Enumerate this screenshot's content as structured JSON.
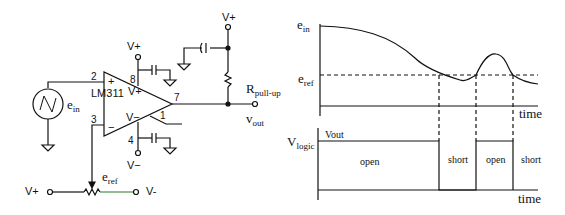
{
  "circuit": {
    "chip": "LM311",
    "pins": {
      "in_plus": "2",
      "in_minus": "3",
      "vplus": "8",
      "vminus": "4",
      "out": "7",
      "gnd": "1"
    },
    "op_symbols": {
      "plus": "+",
      "minus": "−",
      "vplus": "V+",
      "vminus": "V−"
    },
    "supply_top": "V+",
    "supply_bottom": "V−",
    "output_supply": "V+",
    "source_label": "e",
    "source_sub": "in",
    "resistor_label": "R",
    "resistor_sub": "pull-up",
    "output_label": "v",
    "output_sub": "out",
    "ref_label": "e",
    "ref_sub": "ref",
    "pot_left": "V+",
    "pot_right": "V-"
  },
  "timing": {
    "top_y_label": "e",
    "top_y_sub": "in",
    "ref_label": "e",
    "ref_sub": "ref",
    "top_x_label": "time",
    "bottom_y_label": "V",
    "bottom_y_sub": "logic",
    "vout_label": "Vout",
    "bottom_x_label": "time",
    "segments": [
      "open",
      "short",
      "open",
      "short"
    ]
  }
}
